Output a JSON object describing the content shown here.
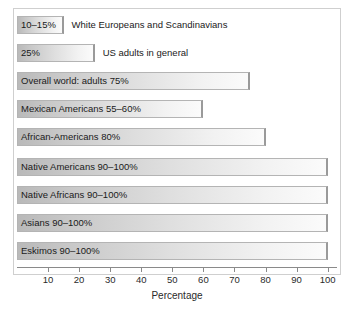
{
  "chart_data": {
    "type": "bar",
    "orientation": "horizontal",
    "title": "",
    "xlabel": "Percentage",
    "ylabel": "",
    "xlim": [
      0,
      103
    ],
    "xticks": [
      10,
      20,
      30,
      40,
      50,
      60,
      70,
      80,
      90,
      100
    ],
    "grid": false,
    "legend": "none",
    "categories": [
      "White Europeans and Scandinavians",
      "US adults in general",
      "Overall world: adults",
      "Mexican Americans",
      "African-Americans",
      "Native Americans",
      "Native Africans",
      "Asians",
      "Eskimos"
    ],
    "values": [
      15,
      25,
      75,
      60,
      80,
      100,
      100,
      100,
      100
    ],
    "bars": [
      {
        "label": "10–15%",
        "annotation": "White Europeans and Scandinavians",
        "value": 15,
        "label_inside": true,
        "label_outside": true
      },
      {
        "label": "25%",
        "annotation": "US adults in general",
        "value": 25,
        "label_inside": true,
        "label_outside": true
      },
      {
        "label": "Overall world: adults 75%",
        "annotation": "",
        "value": 75,
        "label_inside": true,
        "label_outside": false
      },
      {
        "label": "Mexican Americans 55–60%",
        "annotation": "",
        "value": 60,
        "label_inside": true,
        "label_outside": false
      },
      {
        "label": "African-Americans 80%",
        "annotation": "",
        "value": 80,
        "label_inside": true,
        "label_outside": false
      },
      {
        "label": "Native Americans 90–100%",
        "annotation": "",
        "value": 100,
        "label_inside": true,
        "label_outside": false
      },
      {
        "label": "Native Africans 90–100%",
        "annotation": "",
        "value": 100,
        "label_inside": true,
        "label_outside": false
      },
      {
        "label": "Asians 90–100%",
        "annotation": "",
        "value": 100,
        "label_inside": true,
        "label_outside": false
      },
      {
        "label": "Eskimos 90–100%",
        "annotation": "",
        "value": 100,
        "label_inside": true,
        "label_outside": false
      }
    ],
    "colors": {
      "bar_fill_start": "#b9b9b9",
      "bar_fill_end": "#fbfbfb",
      "bar_border": "#b4b4b4",
      "axis": "#8a8a8a",
      "text": "#1a1a1a",
      "frame": "#cfcfcf",
      "background": "#ffffff"
    }
  }
}
